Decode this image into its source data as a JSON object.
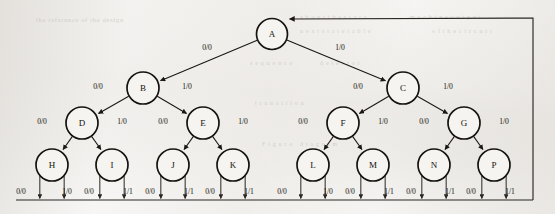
{
  "figure": {
    "kind": "state-transition-tree",
    "background_color": "#f2f0ee",
    "ink_color": "#16130f",
    "node_fill": "#f6f4f1"
  },
  "nodes": [
    {
      "id": "A",
      "label": "A",
      "x": 272,
      "y": 34,
      "r": 15.5,
      "level": 0
    },
    {
      "id": "B",
      "label": "B",
      "x": 143,
      "y": 88,
      "r": 16.0,
      "level": 1
    },
    {
      "id": "C",
      "label": "C",
      "x": 403,
      "y": 88,
      "r": 16.0,
      "level": 1
    },
    {
      "id": "D",
      "label": "D",
      "x": 82,
      "y": 123,
      "r": 16.0,
      "level": 2
    },
    {
      "id": "E",
      "label": "E",
      "x": 203,
      "y": 123,
      "r": 16.0,
      "level": 2
    },
    {
      "id": "F",
      "label": "F",
      "x": 343,
      "y": 123,
      "r": 16.0,
      "level": 2
    },
    {
      "id": "G",
      "label": "G",
      "x": 464,
      "y": 123,
      "r": 16.0,
      "level": 2
    },
    {
      "id": "H",
      "label": "H",
      "x": 52,
      "y": 165,
      "r": 16.0,
      "level": 3
    },
    {
      "id": "I",
      "label": "I",
      "x": 112,
      "y": 165,
      "r": 16.0,
      "level": 3
    },
    {
      "id": "J",
      "label": "J",
      "x": 173,
      "y": 165,
      "r": 16.0,
      "level": 3
    },
    {
      "id": "K",
      "label": "K",
      "x": 233,
      "y": 165,
      "r": 16.0,
      "level": 3
    },
    {
      "id": "L",
      "label": "L",
      "x": 313,
      "y": 165,
      "r": 16.0,
      "level": 3
    },
    {
      "id": "M",
      "label": "M",
      "x": 373,
      "y": 165,
      "r": 16.0,
      "level": 3
    },
    {
      "id": "N",
      "label": "N",
      "x": 434,
      "y": 165,
      "r": 16.0,
      "level": 3
    },
    {
      "id": "P",
      "label": "P",
      "x": 494,
      "y": 165,
      "r": 16.0,
      "level": 3
    }
  ],
  "edges": [
    {
      "from": "A",
      "to": "B",
      "label": "0/0",
      "lx": 207,
      "ly": 48
    },
    {
      "from": "A",
      "to": "C",
      "label": "1/0",
      "lx": 340,
      "ly": 48
    },
    {
      "from": "B",
      "to": "D",
      "label": "0/0",
      "lx": 98,
      "ly": 87
    },
    {
      "from": "B",
      "to": "E",
      "label": "1/0",
      "lx": 187,
      "ly": 87
    },
    {
      "from": "C",
      "to": "F",
      "label": "0/0",
      "lx": 358,
      "ly": 87
    },
    {
      "from": "C",
      "to": "G",
      "label": "1/0",
      "lx": 448,
      "ly": 87
    },
    {
      "from": "D",
      "to": "H",
      "label": "0/0",
      "lx": 42,
      "ly": 122
    },
    {
      "from": "D",
      "to": "I",
      "label": "1/0",
      "lx": 122,
      "ly": 122
    },
    {
      "from": "E",
      "to": "J",
      "label": "0/0",
      "lx": 163,
      "ly": 122
    },
    {
      "from": "E",
      "to": "K",
      "label": "1/0",
      "lx": 243,
      "ly": 122
    },
    {
      "from": "F",
      "to": "L",
      "label": "0/0",
      "lx": 303,
      "ly": 122
    },
    {
      "from": "F",
      "to": "M",
      "label": "1/0",
      "lx": 383,
      "ly": 122
    },
    {
      "from": "G",
      "to": "N",
      "label": "0/0",
      "lx": 424,
      "ly": 122
    },
    {
      "from": "G",
      "to": "P",
      "label": "1/0",
      "lx": 504,
      "ly": 122
    }
  ],
  "leaf_outputs": [
    {
      "node": "H",
      "left_label": "0/0",
      "right_label": "1/0",
      "left_lx": 21,
      "right_lx": 67,
      "ly": 192
    },
    {
      "node": "I",
      "left_label": "0/0",
      "right_label": "1/1",
      "left_lx": 89,
      "right_lx": 128,
      "ly": 192
    },
    {
      "node": "J",
      "left_label": "0/0",
      "right_label": "1/1",
      "left_lx": 150,
      "right_lx": 189,
      "ly": 192
    },
    {
      "node": "K",
      "left_label": "0/0",
      "right_label": "1/1",
      "left_lx": 210,
      "right_lx": 249,
      "ly": 192
    },
    {
      "node": "L",
      "left_label": "0/0",
      "right_label": "1/0",
      "left_lx": 282,
      "right_lx": 328,
      "ly": 192
    },
    {
      "node": "M",
      "left_label": "0/0",
      "right_label": "1/1",
      "left_lx": 350,
      "right_lx": 389,
      "ly": 192
    },
    {
      "node": "N",
      "left_label": "0/0",
      "right_label": "1/1",
      "left_lx": 411,
      "right_lx": 450,
      "ly": 192
    },
    {
      "node": "P",
      "left_label": "0/0",
      "right_label": "1/1",
      "left_lx": 471,
      "right_lx": 510,
      "ly": 192
    }
  ],
  "feedback_path": {
    "description": "return-to-root",
    "bus_y": 200,
    "bus_left_x": 16,
    "bus_right_x": 533,
    "right_edge_x": 533,
    "top_y": 18,
    "target_node": "A"
  },
  "ghost_text": [
    {
      "t": "the reference of the design",
      "x": 36,
      "y": 16,
      "s": 6.5
    },
    {
      "t": "a b o u t   t h e   s t a t e",
      "x": 300,
      "y": 14,
      "s": 6.0
    },
    {
      "t": "m a c h i n e   o u t p u t",
      "x": 410,
      "y": 14,
      "s": 6.0
    },
    {
      "t": "n e x t   s t a t e   t a b l e",
      "x": 300,
      "y": 28,
      "s": 6.0
    },
    {
      "t": "o f   t h e   c i r c u i t",
      "x": 432,
      "y": 28,
      "s": 6.0
    },
    {
      "t": "s e q u e n c e",
      "x": 250,
      "y": 60,
      "s": 6.0
    },
    {
      "t": "d e t e c t o r",
      "x": 320,
      "y": 60,
      "s": 6.0
    },
    {
      "t": "t r a n s i t i o n",
      "x": 255,
      "y": 100,
      "s": 6.0
    },
    {
      "t": "F i g u r e",
      "x": 262,
      "y": 141,
      "s": 6.0
    },
    {
      "t": "d i a g r a m",
      "x": 300,
      "y": 141,
      "s": 6.0
    }
  ]
}
